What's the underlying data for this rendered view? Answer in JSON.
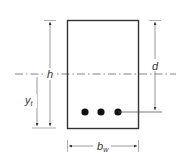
{
  "diagram": {
    "type": "rectangular beam cross-section",
    "labels": {
      "height": "h",
      "effective_depth": "d",
      "neutral_axis_distance": "y",
      "neutral_axis_distance_sub": "t",
      "web_width": "b",
      "web_width_sub": "w"
    },
    "reinforcement_bar_count": 3,
    "colors": {
      "outline": "#333333",
      "dimension": "#555555",
      "bar_fill": "#111111",
      "background": "#ffffff"
    }
  }
}
